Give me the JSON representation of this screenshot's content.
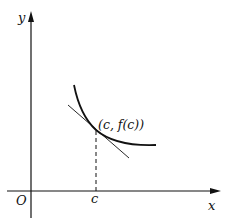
{
  "diagram": {
    "type": "tangent-line-to-curve",
    "axes": {
      "x_label": "x",
      "y_label": "y",
      "origin_label": "O"
    },
    "point": {
      "x_tick_label": "c",
      "label": "(c, f(c))"
    },
    "elements": [
      "x-axis with arrow",
      "y-axis with arrow",
      "decreasing convex curve",
      "tangent line at (c, f(c))",
      "dashed vertical line from point to x-axis"
    ],
    "colors": {
      "stroke": "#111111",
      "background": "#ffffff"
    }
  }
}
